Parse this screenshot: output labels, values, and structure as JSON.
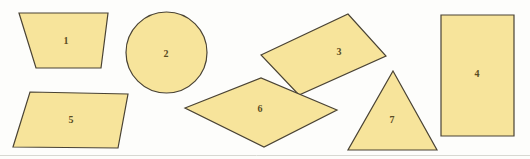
{
  "figure": {
    "name": "geometric-shapes-figure",
    "width": 530,
    "height": 159,
    "background_color": "#fdfdfb",
    "fill_color": "#f7e49b",
    "stroke_color": "#4a4334",
    "label_color": "#5a4c22",
    "baseline_rule_color": "#d8d8d2"
  },
  "shapes": [
    {
      "id": "shape-1",
      "label": "1",
      "kind": "trapezoid",
      "points": "19,13 108,13 101,68 36,68",
      "label_x": 66,
      "label_y": 42
    },
    {
      "id": "shape-2",
      "label": "2",
      "kind": "circle",
      "cx": 166.5,
      "cy": 52.5,
      "r": 40.5,
      "label_x": 166,
      "label_y": 55
    },
    {
      "id": "shape-3",
      "label": "3",
      "kind": "rotated-rectangle",
      "points": "261,55 348,14 386,56 299,95",
      "label_x": 339,
      "label_y": 53
    },
    {
      "id": "shape-4",
      "label": "4",
      "kind": "rectangle",
      "points": "441,15 514,15 514,136 441,136",
      "label_x": 477,
      "label_y": 75
    },
    {
      "id": "shape-5",
      "label": "5",
      "kind": "parallelogram",
      "points": "30,92 128,94 118,148 13,147",
      "label_x": 71,
      "label_y": 121
    },
    {
      "id": "shape-6",
      "label": "6",
      "kind": "rhombus",
      "points": "185,108 261,78 337,110 264,147",
      "label_x": 260,
      "label_y": 110
    },
    {
      "id": "shape-7",
      "label": "7",
      "kind": "triangle",
      "points": "393,71 437,150 348,150",
      "label_x": 392,
      "label_y": 121
    }
  ],
  "baseline_rule": {
    "x1": 0,
    "y1": 155.5,
    "x2": 530,
    "y2": 155.5
  }
}
